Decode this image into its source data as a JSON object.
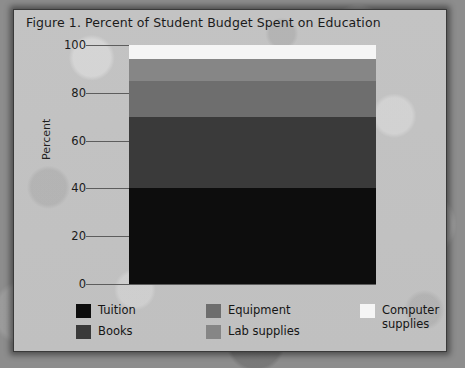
{
  "figure": {
    "title": "Figure 1. Percent of Student Budget Spent on Education"
  },
  "axes": {
    "ylabel": "Percent",
    "yticks": [
      "0",
      "20",
      "40",
      "60",
      "80",
      "100"
    ]
  },
  "legend": {
    "columns": [
      {
        "entries": [
          {
            "label": "Tuition",
            "color": "#0d0d0d"
          },
          {
            "label": "Books",
            "color": "#3a3a3a"
          }
        ]
      },
      {
        "entries": [
          {
            "label": "Equipment",
            "color": "#6e6e6e"
          },
          {
            "label": "Lab supplies",
            "color": "#868686"
          }
        ]
      },
      {
        "entries": [
          {
            "label": "Computer\nsupplies",
            "color": "#f5f5f5"
          }
        ]
      }
    ]
  },
  "chart_data": {
    "type": "bar",
    "subtype": "stacked-single-bar",
    "title": "Figure 1. Percent of Student Budget Spent on Education",
    "xlabel": "",
    "ylabel": "Percent",
    "ylim": [
      0,
      100
    ],
    "yticks": [
      0,
      20,
      40,
      60,
      80,
      100
    ],
    "grid": true,
    "legend_position": "bottom",
    "categories": [
      "Student Budget"
    ],
    "series": [
      {
        "name": "Tuition",
        "values": [
          40
        ],
        "color": "#0d0d0d"
      },
      {
        "name": "Equipment",
        "values": [
          30
        ],
        "color": "#3a3a3a"
      },
      {
        "name": "Lab supplies",
        "values": [
          15
        ],
        "color": "#6e6e6e"
      },
      {
        "name": "Books",
        "values": [
          9
        ],
        "color": "#868686"
      },
      {
        "name": "Computer supplies",
        "values": [
          6
        ],
        "color": "#f5f5f5"
      }
    ],
    "stack_order_bottom_to_top": [
      "Tuition",
      "Equipment",
      "Lab supplies",
      "Books",
      "Computer supplies"
    ],
    "cumulative_tops": [
      40,
      70,
      85,
      94,
      100
    ]
  }
}
